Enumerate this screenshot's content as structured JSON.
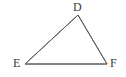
{
  "figure": {
    "name": "triangle-DEF",
    "type": "geometric-diagram",
    "background_color": "#ffffff",
    "stroke_color": "#5c5c5c",
    "stroke_width": 1,
    "label_color": "#3d3d3d",
    "vertices": [
      {
        "id": "D",
        "label": "D",
        "x": 78,
        "y": 15,
        "label_x": 73,
        "label_y": 1
      },
      {
        "id": "E",
        "label": "E",
        "x": 25,
        "y": 64,
        "label_x": 13,
        "label_y": 57
      },
      {
        "id": "F",
        "label": "F",
        "x": 107,
        "y": 64,
        "label_x": 110,
        "label_y": 57
      }
    ],
    "edges": [
      {
        "id": "DE",
        "from": "D",
        "to": "E",
        "points": "78,15 25,64"
      },
      {
        "id": "EF",
        "from": "E",
        "to": "F",
        "points": "25,64 107,64"
      },
      {
        "id": "FD",
        "from": "F",
        "to": "D",
        "points": "107,64 78,15"
      }
    ],
    "polygon_points": "78,15 107,64 25,64"
  }
}
